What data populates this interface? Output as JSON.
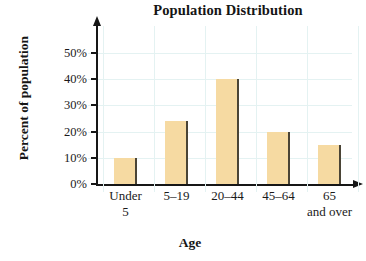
{
  "chart_data": {
    "type": "bar",
    "title": "Population Distribution",
    "xlabel": "Age",
    "ylabel": "Percent of population",
    "categories": [
      "Under 5",
      "5–19",
      "20–44",
      "45–64",
      "65 and over"
    ],
    "category_lines": [
      {
        "line1": "Under",
        "line2": "5"
      },
      {
        "line1": "5–19",
        "line2": ""
      },
      {
        "line1": "20–44",
        "line2": ""
      },
      {
        "line1": "45–64",
        "line2": ""
      },
      {
        "line1": "65",
        "line2": "and over"
      }
    ],
    "values": [
      10,
      24,
      40,
      20,
      15
    ],
    "value_labels": [
      "10%",
      "24%",
      "40%",
      "20%",
      "15%"
    ],
    "ylim": [
      0,
      55
    ],
    "yticks": [
      0,
      10,
      20,
      30,
      40,
      50
    ],
    "ytick_labels": [
      "0%",
      "10%",
      "20%",
      "30%",
      "40%",
      "50%"
    ],
    "grid": true,
    "legend": false,
    "bar_color": "#f6daa2",
    "bar_edge_color": "#4a4436",
    "grid_color": "#e4f2f2",
    "axis_color": "#161616"
  }
}
